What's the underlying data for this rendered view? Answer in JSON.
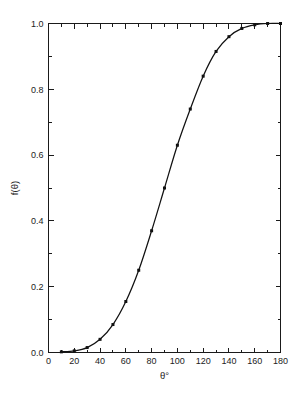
{
  "chart_data": {
    "type": "line",
    "title": "",
    "subtitle": "",
    "xlabel": "θ°",
    "ylabel": "f(θ)",
    "xlim": [
      0,
      180
    ],
    "ylim": [
      0.0,
      1.0
    ],
    "grid": false,
    "legend": null,
    "legend_position": "none",
    "marker": "square",
    "line_color": "#111111",
    "marker_color": "#111111",
    "background_color": "#ffffff",
    "x_major_ticks": [
      0,
      20,
      40,
      60,
      80,
      100,
      120,
      140,
      160,
      180
    ],
    "x_major_tick_labels": [
      "0",
      "20",
      "40",
      "60",
      "80",
      "100",
      "120",
      "140",
      "160",
      "180"
    ],
    "x_minor_ticks": [
      10,
      30,
      50,
      70,
      90,
      110,
      130,
      150,
      170
    ],
    "y_major_ticks": [
      0.0,
      0.2,
      0.4,
      0.6,
      0.8,
      1.0
    ],
    "y_major_tick_labels": [
      "0.0",
      "0.2",
      "0.4",
      "0.6",
      "0.8",
      "1.0"
    ],
    "y_minor_ticks": [
      0.1,
      0.3,
      0.5,
      0.7,
      0.9,
      1.1
    ],
    "x": [
      10,
      20,
      30,
      40,
      50,
      60,
      70,
      80,
      90,
      100,
      110,
      120,
      130,
      140,
      150,
      160,
      170,
      180
    ],
    "y": [
      0.002,
      0.005,
      0.015,
      0.04,
      0.085,
      0.155,
      0.25,
      0.37,
      0.5,
      0.63,
      0.74,
      0.84,
      0.915,
      0.96,
      0.985,
      0.996,
      1.0,
      1.0
    ],
    "series": [
      {
        "name": "f(θ)",
        "x": [
          10,
          20,
          30,
          40,
          50,
          60,
          70,
          80,
          90,
          100,
          110,
          120,
          130,
          140,
          150,
          160,
          170,
          180
        ],
        "values": [
          0.002,
          0.005,
          0.015,
          0.04,
          0.085,
          0.155,
          0.25,
          0.37,
          0.5,
          0.63,
          0.74,
          0.84,
          0.915,
          0.96,
          0.985,
          0.996,
          1.0,
          1.0
        ]
      }
    ],
    "annotations": []
  }
}
